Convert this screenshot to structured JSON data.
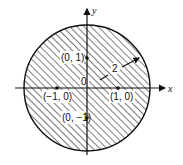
{
  "figure": {
    "colors": {
      "ink": "#111111",
      "background": "#ffffff"
    },
    "axes": {
      "x_label": "x",
      "y_label": "y"
    },
    "origin_label": "0",
    "radius_label": "2",
    "points": [
      {
        "label": "(0, 1)",
        "x": 0,
        "y": 1
      },
      {
        "label": "(−1, 0)",
        "x": -1,
        "y": 0
      },
      {
        "label": "(1, 0)",
        "x": 1,
        "y": 0
      },
      {
        "label": "(0, −1)",
        "x": 0,
        "y": -1
      }
    ]
  }
}
